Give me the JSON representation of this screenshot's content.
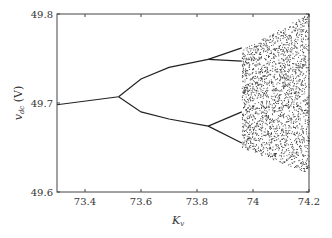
{
  "chart_data": {
    "type": "scatter",
    "title": "",
    "xlabel": "K_v",
    "ylabel": "v_dc (V)",
    "xlim": [
      73.3,
      74.2
    ],
    "ylim": [
      49.6,
      49.8
    ],
    "x_ticks": [
      "73.4",
      "73.6",
      "73.8",
      "74",
      "74.2"
    ],
    "y_ticks": [
      "49.6",
      "49.7",
      "49.8"
    ],
    "grid": false,
    "legend": null,
    "series": [
      {
        "name": "period-1",
        "x": [
          73.3,
          73.52
        ],
        "y": [
          49.698,
          49.707
        ]
      },
      {
        "name": "period-2 upper",
        "x": [
          73.52,
          73.6,
          73.7,
          73.84
        ],
        "y": [
          49.707,
          49.727,
          49.74,
          49.749
        ]
      },
      {
        "name": "period-2 lower",
        "x": [
          73.52,
          73.6,
          73.7,
          73.84
        ],
        "y": [
          49.707,
          49.69,
          49.682,
          49.674
        ]
      },
      {
        "name": "period-4 a",
        "x": [
          73.84,
          73.96
        ],
        "y": [
          49.749,
          49.762
        ]
      },
      {
        "name": "period-4 b",
        "x": [
          73.84,
          73.96
        ],
        "y": [
          49.749,
          49.747
        ]
      },
      {
        "name": "period-4 c",
        "x": [
          73.84,
          73.96
        ],
        "y": [
          49.674,
          49.69
        ]
      },
      {
        "name": "period-4 d",
        "x": [
          73.84,
          73.96
        ],
        "y": [
          49.674,
          49.655
        ]
      },
      {
        "name": "chaos region",
        "x": [
          73.96,
          74.2
        ],
        "y": [
          49.62,
          49.8
        ]
      }
    ]
  },
  "labels": {
    "x_axis": "K",
    "x_axis_sub": "v",
    "y_axis": "v",
    "y_axis_sub": "dc",
    "y_axis_unit": " (V)"
  }
}
